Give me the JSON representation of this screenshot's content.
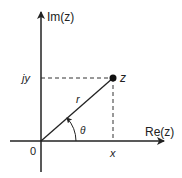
{
  "diagram": {
    "type": "complex-plane-polar-representation",
    "axes": {
      "x_label": "Re(z)",
      "y_label": "Im(z)",
      "origin_label": "0"
    },
    "point": {
      "label": "z",
      "x_projection_label": "x",
      "y_projection_label": "jy"
    },
    "vector": {
      "magnitude_label": "r",
      "angle_label": "θ"
    },
    "colors": {
      "stroke": "#222222",
      "background": "#ffffff"
    }
  }
}
